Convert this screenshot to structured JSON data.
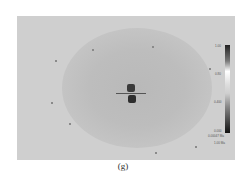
{
  "figure": {
    "caption": "(g)",
    "colorbar": {
      "labels": [
        "1.00",
        "0.80",
        "0.400",
        "0.000"
      ],
      "units": [
        "0.00047 Ma",
        "1.00 Ma"
      ]
    }
  }
}
